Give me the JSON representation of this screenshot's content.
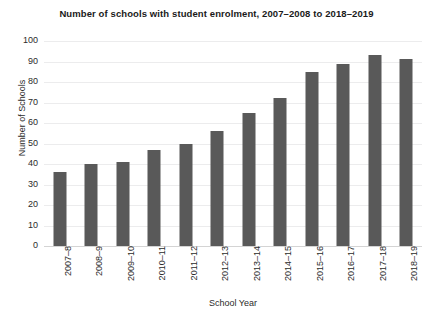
{
  "chart_data": {
    "type": "bar",
    "title": "Number of schools with student enrolment, 2007–2008 to 2018–2019",
    "xlabel": "School Year",
    "ylabel": "Number of Schools",
    "categories": [
      "2007–8",
      "2008–9",
      "2009–10",
      "2010–11",
      "2011–12",
      "2012–13",
      "2013–14",
      "2014–15",
      "2015–16",
      "2016–17",
      "2017–18",
      "2018–19"
    ],
    "values": [
      36,
      40,
      41,
      47,
      50,
      56,
      65,
      72,
      85,
      89,
      93,
      91
    ],
    "ylim": [
      0,
      100
    ],
    "ytick_step": 10,
    "yticks": [
      "100",
      "90",
      "80",
      "70",
      "60",
      "50",
      "40",
      "30",
      "20",
      "10",
      "0"
    ],
    "grid": true,
    "legend": false,
    "bar_color": "#595959",
    "gridline_color": "#ececed",
    "background_color": "#ffffff"
  }
}
